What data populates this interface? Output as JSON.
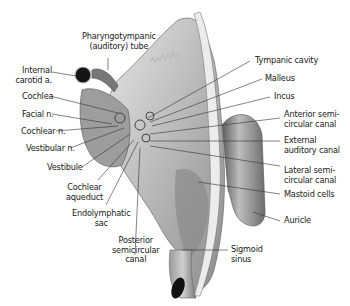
{
  "diagram": {
    "labels": {
      "pharyngotympanic_1": "Pharyngotympanic",
      "pharyngotympanic_2": "(auditory) tube",
      "internal_carotid_1": "Internal",
      "internal_carotid_2": "carotid a.",
      "cochlea": "Cochlea",
      "facial": "Facial n.",
      "cochlear_n": "Cochlear n.",
      "vestibular_n": "Vestibular n.",
      "vestibule": "Vestibule",
      "cochlear_aqueduct_1": "Cochlear",
      "cochlear_aqueduct_2": "aqueduct",
      "endolymphatic_1": "Endolymphatic",
      "endolymphatic_2": "sac",
      "posterior_1": "Posterior",
      "posterior_2": "semicircular",
      "posterior_3": "canal",
      "tympanic_cavity": "Tympanic cavity",
      "malleus": "Malleus",
      "incus": "Incus",
      "anterior_1": "Anterior semi-",
      "anterior_2": "circular canal",
      "external_1": "External",
      "external_2": "auditory canal",
      "lateral_1": "Lateral semi-",
      "lateral_2": "circular canal",
      "mastoid": "Mastoid cells",
      "auricle": "Auricle",
      "sigmoid_1": "Sigmoid",
      "sigmoid_2": "sinus"
    },
    "colors": {
      "bone_light": "#d8d8d8",
      "bone_mid": "#a8a8a8",
      "bone_dark": "#6a6a6a",
      "vessel": "#1e1e1e",
      "leader": "#333333",
      "text": "#1a1a1a"
    }
  }
}
